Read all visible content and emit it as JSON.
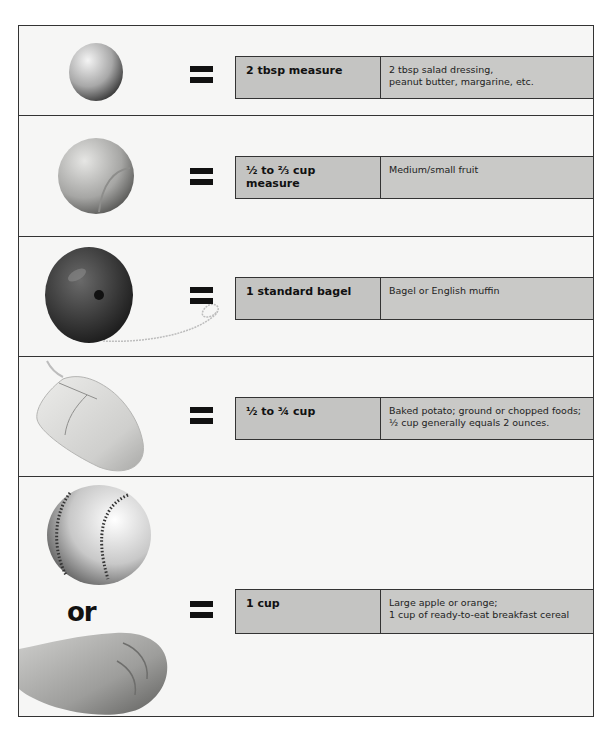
{
  "rows": [
    {
      "object": "golf-ball",
      "equals": "=",
      "measure": "2 tbsp measure",
      "description_lines": [
        "2 tbsp salad dressing,",
        "peanut butter, margarine, etc."
      ]
    },
    {
      "object": "tennis-ball",
      "equals": "=",
      "measure_lines": [
        "½ to ⅔ cup",
        "measure"
      ],
      "description_lines": [
        "Medium/small fruit"
      ]
    },
    {
      "object": "yo-yo",
      "equals": "=",
      "measure": "1 standard bagel",
      "description_lines": [
        "Bagel or English muffin"
      ]
    },
    {
      "object": "computer-mouse",
      "equals": "=",
      "measure": "½ to ¾ cup",
      "description_lines": [
        "Baked potato; ground or chopped foods;",
        "½ cup generally equals 2 ounces."
      ]
    },
    {
      "object": "baseball-or-fist",
      "or_label": "or",
      "equals": "=",
      "measure": "1 cup",
      "description_lines": [
        "Large apple or orange;",
        "1 cup of ready-to-eat breakfast cereal"
      ]
    }
  ],
  "colors": {
    "frame_border": "#333333",
    "box_fill": "#c9c9c7",
    "background": "#f6f6f5"
  }
}
